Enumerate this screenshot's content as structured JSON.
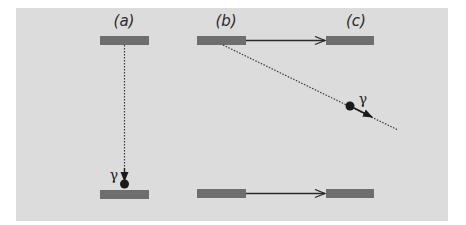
{
  "diagram": {
    "panels": [
      {
        "id": "a",
        "label": "(a)"
      },
      {
        "id": "b",
        "label": "(b)"
      },
      {
        "id": "c",
        "label": "(c)"
      }
    ],
    "photon_symbol": "γ",
    "colors": {
      "background": "#dcdcdc",
      "level_bar": "#6e6e6e",
      "arrow": "#2a2a2a",
      "photon": "#1a1a1a"
    }
  }
}
